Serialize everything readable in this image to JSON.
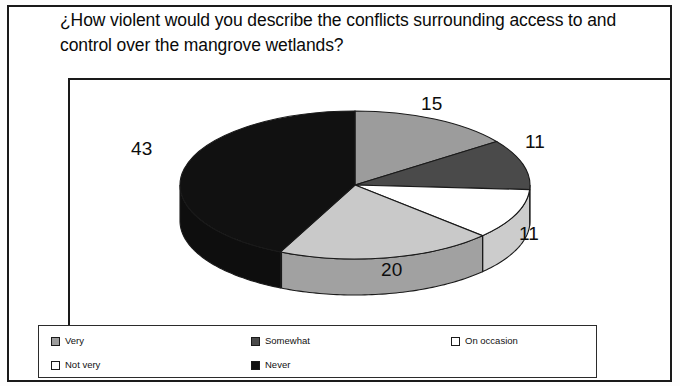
{
  "chart_data": {
    "type": "pie",
    "title": "¿How violent would you describe the conflicts surrounding access to and control over the mangrove wetlands?",
    "categories": [
      "Very",
      "Somewhat",
      "On occasion",
      "Not very",
      "Never"
    ],
    "values": [
      15,
      11,
      11,
      20,
      43
    ],
    "labels": [
      "15",
      "11",
      "11",
      "20",
      "43"
    ],
    "colors": [
      "#9c9c9c",
      "#4a4a4a",
      "#ffffff",
      "#c9c9c9",
      "#111111"
    ],
    "legend_position": "bottom",
    "three_d": true,
    "grid": false,
    "xlabel": "",
    "ylabel": "",
    "slices": [
      {
        "name": "Very",
        "value": 15,
        "label": "15",
        "color": "#9c9c9c",
        "label_x": 421,
        "label_y": 93
      },
      {
        "name": "Somewhat",
        "value": 11,
        "label": "11",
        "color": "#4a4a4a",
        "label_x": 525,
        "label_y": 131
      },
      {
        "name": "On occasion",
        "value": 11,
        "label": "11",
        "color": "#ffffff",
        "label_x": 519,
        "label_y": 223
      },
      {
        "name": "Not very",
        "value": 20,
        "label": "20",
        "color": "#c9c9c9",
        "label_x": 381,
        "label_y": 259
      },
      {
        "name": "Never",
        "value": 43,
        "label": "43",
        "color": "#111111",
        "label_x": 131,
        "label_y": 138
      }
    ]
  },
  "legend": {
    "items": [
      {
        "label": "Very",
        "color": "#9c9c9c",
        "border": "#1a1a1a"
      },
      {
        "label": "Somewhat",
        "color": "#4a4a4a",
        "border": "#1a1a1a"
      },
      {
        "label": "On occasion",
        "color": "#ffffff",
        "border": "#1a1a1a"
      },
      {
        "label": "Not very",
        "color": "#fbfbfb",
        "border": "#1a1a1a"
      },
      {
        "label": "Never",
        "color": "#111111",
        "border": "#1a1a1a"
      }
    ]
  }
}
